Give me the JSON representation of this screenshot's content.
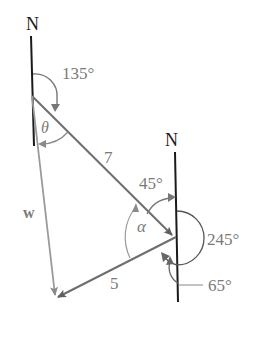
{
  "diagram": {
    "type": "vector-bearing-diagram",
    "north_labels": [
      "N",
      "N"
    ],
    "angles": {
      "top_bearing": "135°",
      "theta": "θ",
      "alpha": "α",
      "angle_45": "45°",
      "angle_245": "245°",
      "angle_65": "65°"
    },
    "sides": {
      "side_7": "7",
      "side_5": "5",
      "side_w": "w"
    },
    "colors": {
      "line_black": "#1a1a1a",
      "vector_gray": "#6e6e6e",
      "light_gray": "#9a9a9a",
      "text_gray": "#7a7a7a"
    }
  }
}
